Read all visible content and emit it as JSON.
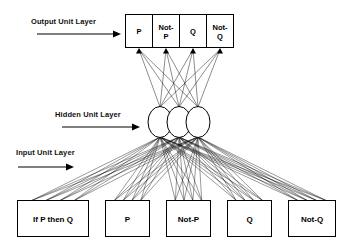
{
  "diagram": {
    "layers": [
      {
        "id": "output",
        "label": "Output Unit Layer",
        "type": "boxes",
        "units": [
          "P",
          "Not-P",
          "Q",
          "Not-Q"
        ]
      },
      {
        "id": "hidden",
        "label": "Hidden Unit Layer",
        "type": "circles",
        "count": 3,
        "units": [
          "",
          "",
          ""
        ]
      },
      {
        "id": "input",
        "label": "Input Unit Layer",
        "type": "boxes",
        "units": [
          "If P then Q",
          "P",
          "Not-P",
          "Q",
          "Not-Q"
        ]
      }
    ],
    "connections": {
      "hidden_to_output": "fully-connected",
      "input_to_hidden": "fully-connected",
      "arrowheads": "up-into-output-boxes"
    },
    "colors": {
      "stroke": "#000000",
      "fill": "#ffffff",
      "background": "#ffffff",
      "text": "#000000"
    }
  }
}
